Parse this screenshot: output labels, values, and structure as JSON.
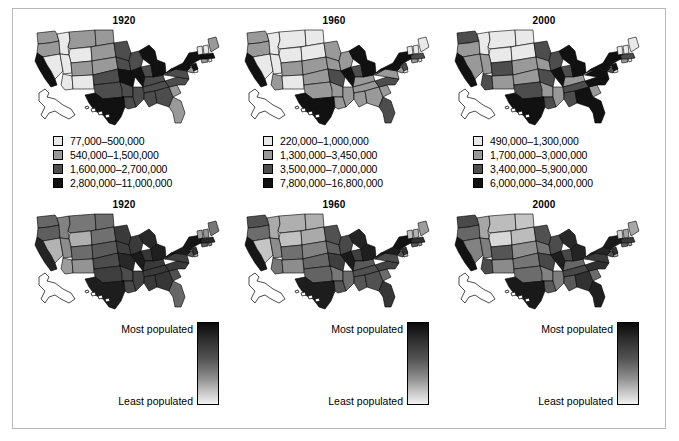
{
  "figure": {
    "border_color": "#b9b9b9",
    "background": "#ffffff"
  },
  "palette": {
    "class1": "#e9e9e9",
    "class2": "#999999",
    "class3": "#4d4d4d",
    "class4": "#111111",
    "outline": "#000000",
    "noncontiguous_fill": "#ffffff"
  },
  "top_row": {
    "panels": [
      {
        "title": "1920",
        "legend": [
          {
            "swatch": "#e9e9e9",
            "label": "77,000–500,000"
          },
          {
            "swatch": "#999999",
            "label": "540,000–1,500,000"
          },
          {
            "swatch": "#4d4d4d",
            "label": "1,600,000–2,700,000"
          },
          {
            "swatch": "#111111",
            "label": "2,800,000–11,000,000"
          }
        ]
      },
      {
        "title": "1960",
        "legend": [
          {
            "swatch": "#e9e9e9",
            "label": "220,000–1,000,000"
          },
          {
            "swatch": "#999999",
            "label": "1,300,000–3,450,000"
          },
          {
            "swatch": "#4d4d4d",
            "label": "3,500,000–7,000,000"
          },
          {
            "swatch": "#111111",
            "label": "7,800,000–16,800,000"
          }
        ]
      },
      {
        "title": "2000",
        "legend": [
          {
            "swatch": "#e9e9e9",
            "label": "490,000–1,300,000"
          },
          {
            "swatch": "#999999",
            "label": "1,700,000–3,000,000"
          },
          {
            "swatch": "#4d4d4d",
            "label": "3,400,000–5,900,000"
          },
          {
            "swatch": "#111111",
            "label": "6,000,000–34,000,000"
          }
        ]
      }
    ]
  },
  "bottom_row": {
    "panels": [
      {
        "title": "1920",
        "gradient": {
          "most_label": "Most populated",
          "least_label": "Least populated"
        }
      },
      {
        "title": "1960",
        "gradient": {
          "most_label": "Most populated",
          "least_label": "Least populated"
        }
      },
      {
        "title": "2000",
        "gradient": {
          "most_label": "Most populated",
          "least_label": "Least populated"
        }
      }
    ]
  },
  "chart_data": {
    "type": "map",
    "rows": [
      {
        "row": "top",
        "symbology": "classed",
        "classes": 4,
        "panels": [
          {
            "year": "1920",
            "class_breaks": [
              "77,000–500,000",
              "540,000–1,500,000",
              "1,600,000–2,700,000",
              "2,800,000–11,000,000"
            ],
            "class_colors": [
              "#e9e9e9",
              "#999999",
              "#4d4d4d",
              "#111111"
            ],
            "state_classes": {
              "WA": 2,
              "OR": 2,
              "CA": 4,
              "ID": 1,
              "NV": 1,
              "MT": 2,
              "WY": 1,
              "UT": 1,
              "AZ": 1,
              "CO": 2,
              "NM": 1,
              "ND": 2,
              "SD": 2,
              "NE": 2,
              "KS": 3,
              "OK": 3,
              "TX": 4,
              "MN": 3,
              "IA": 3,
              "MO": 4,
              "AR": 3,
              "LA": 3,
              "WI": 3,
              "IL": 4,
              "MS": 3,
              "MI": 4,
              "IN": 3,
              "KY": 3,
              "TN": 3,
              "AL": 3,
              "OH": 4,
              "GA": 3,
              "FL": 2,
              "SC": 2,
              "NC": 3,
              "VA": 3,
              "WV": 2,
              "PA": 4,
              "NY": 4,
              "MD": 2,
              "DE": 1,
              "NJ": 4,
              "CT": 2,
              "RI": 1,
              "MA": 4,
              "VT": 1,
              "NH": 1,
              "ME": 2,
              "AK": 1,
              "HI": 1
            }
          },
          {
            "year": "1960",
            "class_breaks": [
              "220,000–1,000,000",
              "1,300,000–3,450,000",
              "3,500,000–7,000,000",
              "7,800,000–16,800,000"
            ],
            "class_colors": [
              "#e9e9e9",
              "#999999",
              "#4d4d4d",
              "#111111"
            ],
            "state_classes": {
              "WA": 2,
              "OR": 2,
              "CA": 4,
              "ID": 1,
              "NV": 1,
              "MT": 1,
              "WY": 1,
              "UT": 1,
              "AZ": 2,
              "CO": 2,
              "NM": 1,
              "ND": 1,
              "SD": 1,
              "NE": 2,
              "KS": 2,
              "OK": 2,
              "TX": 4,
              "MN": 2,
              "IA": 2,
              "MO": 3,
              "AR": 2,
              "LA": 2,
              "WI": 2,
              "IL": 4,
              "MS": 2,
              "MI": 4,
              "IN": 3,
              "KY": 2,
              "TN": 2,
              "AL": 2,
              "OH": 4,
              "GA": 2,
              "FL": 3,
              "SC": 2,
              "NC": 3,
              "VA": 2,
              "WV": 2,
              "PA": 4,
              "NY": 4,
              "MD": 2,
              "DE": 1,
              "NJ": 3,
              "CT": 2,
              "RI": 1,
              "MA": 3,
              "VT": 1,
              "NH": 1,
              "ME": 1,
              "AK": 1,
              "HI": 1
            }
          },
          {
            "year": "2000",
            "class_breaks": [
              "490,000–1,300,000",
              "1,700,000–3,000,000",
              "3,400,000–5,900,000",
              "6,000,000–34,000,000"
            ],
            "class_colors": [
              "#e9e9e9",
              "#999999",
              "#4d4d4d",
              "#111111"
            ],
            "state_classes": {
              "WA": 3,
              "OR": 2,
              "CA": 4,
              "ID": 1,
              "NV": 2,
              "MT": 1,
              "WY": 1,
              "UT": 2,
              "AZ": 3,
              "CO": 3,
              "NM": 2,
              "ND": 1,
              "SD": 1,
              "NE": 2,
              "KS": 2,
              "OK": 3,
              "TX": 4,
              "MN": 3,
              "IA": 2,
              "MO": 3,
              "AR": 2,
              "LA": 3,
              "WI": 3,
              "IL": 4,
              "MS": 2,
              "MI": 4,
              "IN": 3,
              "KY": 2,
              "TN": 3,
              "AL": 3,
              "OH": 4,
              "GA": 4,
              "FL": 4,
              "SC": 2,
              "NC": 4,
              "VA": 4,
              "WV": 1,
              "PA": 4,
              "NY": 4,
              "MD": 3,
              "DE": 1,
              "NJ": 4,
              "CT": 2,
              "RI": 1,
              "MA": 3,
              "VT": 1,
              "NH": 1,
              "ME": 1,
              "AK": 1,
              "HI": 1
            }
          }
        ]
      },
      {
        "row": "bottom",
        "symbology": "continuous",
        "scale_labels": {
          "high": "Most populated",
          "low": "Least populated"
        },
        "panels": [
          {
            "year": "1920",
            "state_values": {
              "WA": 0.62,
              "OR": 0.66,
              "CA": 0.92,
              "ID": 0.5,
              "NV": 0.28,
              "MT": 0.55,
              "WY": 0.3,
              "UT": 0.45,
              "AZ": 0.38,
              "CO": 0.6,
              "NM": 0.42,
              "ND": 0.6,
              "SD": 0.58,
              "NE": 0.68,
              "KS": 0.74,
              "OK": 0.8,
              "TX": 0.95,
              "MN": 0.82,
              "IA": 0.8,
              "MO": 0.9,
              "AR": 0.74,
              "LA": 0.76,
              "WI": 0.82,
              "IL": 0.96,
              "MS": 0.78,
              "MI": 0.9,
              "IN": 0.84,
              "KY": 0.82,
              "TN": 0.82,
              "AL": 0.82,
              "OH": 0.94,
              "GA": 0.84,
              "FL": 0.62,
              "SC": 0.72,
              "NC": 0.82,
              "VA": 0.8,
              "WV": 0.72,
              "PA": 0.96,
              "NY": 0.98,
              "MD": 0.68,
              "DE": 0.35,
              "NJ": 0.86,
              "CT": 0.66,
              "RI": 0.5,
              "MA": 0.9,
              "VT": 0.38,
              "NH": 0.42,
              "ME": 0.55,
              "AK": 0.05,
              "HI": 0.3
            }
          },
          {
            "year": "1960",
            "state_values": {
              "WA": 0.72,
              "OR": 0.6,
              "CA": 0.98,
              "ID": 0.32,
              "NV": 0.2,
              "MT": 0.3,
              "WY": 0.22,
              "UT": 0.45,
              "AZ": 0.55,
              "CO": 0.58,
              "NM": 0.45,
              "ND": 0.3,
              "SD": 0.32,
              "NE": 0.5,
              "KS": 0.62,
              "OK": 0.64,
              "TX": 0.95,
              "MN": 0.72,
              "IA": 0.66,
              "MO": 0.8,
              "AR": 0.55,
              "LA": 0.7,
              "WI": 0.76,
              "IL": 0.96,
              "MS": 0.6,
              "MI": 0.92,
              "IN": 0.8,
              "KY": 0.68,
              "TN": 0.72,
              "AL": 0.7,
              "OH": 0.94,
              "GA": 0.72,
              "FL": 0.84,
              "SC": 0.6,
              "NC": 0.78,
              "VA": 0.74,
              "WV": 0.6,
              "PA": 0.95,
              "NY": 0.99,
              "MD": 0.7,
              "DE": 0.25,
              "NJ": 0.86,
              "CT": 0.68,
              "RI": 0.42,
              "MA": 0.86,
              "VT": 0.22,
              "NH": 0.28,
              "ME": 0.38,
              "AK": 0.02,
              "HI": 0.3
            }
          },
          {
            "year": "2000",
            "state_values": {
              "WA": 0.75,
              "OR": 0.62,
              "CA": 1.0,
              "ID": 0.34,
              "NV": 0.5,
              "MT": 0.24,
              "WY": 0.12,
              "UT": 0.52,
              "AZ": 0.74,
              "CO": 0.7,
              "NM": 0.46,
              "ND": 0.2,
              "SD": 0.24,
              "NE": 0.44,
              "KS": 0.56,
              "OK": 0.6,
              "TX": 0.97,
              "MN": 0.72,
              "IA": 0.56,
              "MO": 0.76,
              "AR": 0.5,
              "LA": 0.68,
              "WI": 0.74,
              "IL": 0.94,
              "MS": 0.52,
              "MI": 0.9,
              "IN": 0.76,
              "KY": 0.62,
              "TN": 0.76,
              "AL": 0.68,
              "OH": 0.92,
              "GA": 0.86,
              "FL": 0.94,
              "SC": 0.6,
              "NC": 0.86,
              "VA": 0.82,
              "WV": 0.42,
              "PA": 0.92,
              "NY": 0.96,
              "MD": 0.72,
              "DE": 0.26,
              "NJ": 0.86,
              "CT": 0.64,
              "RI": 0.36,
              "MA": 0.82,
              "VT": 0.16,
              "NH": 0.34,
              "ME": 0.34,
              "AK": 0.08,
              "HI": 0.4
            }
          }
        ]
      }
    ]
  }
}
